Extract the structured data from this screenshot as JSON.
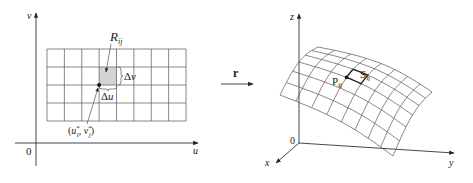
{
  "figure": {
    "left_panel": {
      "axis_labels": {
        "vertical": "v",
        "horizontal": "u",
        "origin": "0"
      },
      "grid": {
        "columns": 8,
        "rows": 4
      },
      "region_label": {
        "main": "R",
        "sub": "ij"
      },
      "shaded_cell": {
        "column": 4,
        "row": 2,
        "fill": "#d4d4d4"
      },
      "delta_v_label": {
        "delta": "Δ",
        "var": "v"
      },
      "delta_u_label": {
        "delta": "Δ",
        "var": "u"
      },
      "point_label": {
        "open": "(",
        "u": "u",
        "u_sub": "i",
        "comma": ", ",
        "v": "v",
        "v_sub": "j",
        "star": "*",
        "close": ")"
      }
    },
    "mapping": {
      "label": "r"
    },
    "right_panel": {
      "axis_labels": {
        "z": "z",
        "y": "y",
        "x": "x",
        "origin": "0"
      },
      "surface_grid": {
        "u_lines": 8,
        "v_lines": 6
      },
      "point_label": {
        "main": "P",
        "sub": "ij"
      },
      "patch_label": {
        "main": "S",
        "sub": "ij"
      }
    }
  }
}
